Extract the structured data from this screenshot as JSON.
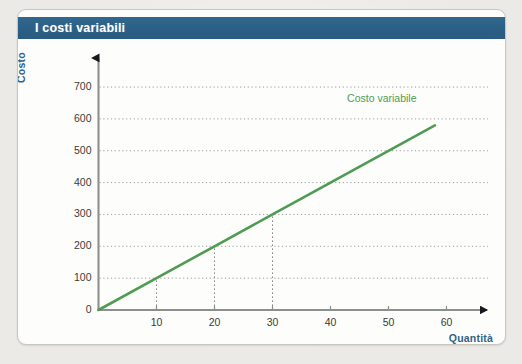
{
  "card": {
    "title": "I costi variabili",
    "title_color": "#2d6388"
  },
  "axis_label_color": "#2f6389",
  "series_color": "#4f9b52",
  "chart_data": {
    "type": "line",
    "title": "I costi variabili",
    "xlabel": "Quantità",
    "ylabel": "Costo",
    "xlim": [
      0,
      67
    ],
    "ylim": [
      0,
      760
    ],
    "xticks": [
      10,
      20,
      30,
      40,
      50,
      60
    ],
    "xtick_labels": [
      "10",
      "20",
      "30",
      "40",
      "50",
      "60"
    ],
    "yticks": [
      0,
      100,
      200,
      300,
      400,
      500,
      600,
      700
    ],
    "ytick_labels": [
      "0",
      "100",
      "200",
      "300",
      "400",
      "500",
      "600",
      "700"
    ],
    "grid": "horizontal-dotted",
    "legend_position": "inline-right",
    "series": [
      {
        "name": "Costo variabile",
        "color": "#4f9b52",
        "x": [
          0,
          10,
          20,
          30,
          40,
          58
        ],
        "values": [
          0,
          100,
          200,
          300,
          400,
          580
        ]
      }
    ],
    "droplines": [
      {
        "x": 10,
        "y": 100
      },
      {
        "x": 20,
        "y": 200
      },
      {
        "x": 30,
        "y": 300
      }
    ],
    "annotations": [
      {
        "text": "Costo variabile",
        "x": 47,
        "y": 660,
        "color": "#4f9b52"
      }
    ]
  }
}
